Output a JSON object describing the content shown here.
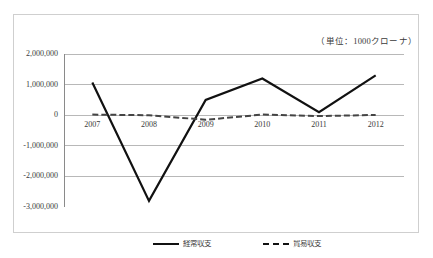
{
  "unit_caption": "（単位：1000クローナ）",
  "chart_data": {
    "type": "line",
    "title": "",
    "subtitle": "",
    "xlabel": "",
    "ylabel": "",
    "unit_note": "（単位：1000クローナ）",
    "categories": [
      "2007",
      "2008",
      "2009",
      "2010",
      "2011",
      "2012"
    ],
    "x_tick_labels": [
      "2007",
      "2008",
      "2009",
      "2010",
      "2011",
      "2012"
    ],
    "y_tick_labels": [
      "2,000,000",
      "1,000,000",
      "0",
      "-1,000,000",
      "-2,000,000",
      "-3,000,000"
    ],
    "y_tick_values": [
      2000000,
      1000000,
      0,
      -1000000,
      -2000000,
      -3000000
    ],
    "ylim": [
      -3000000,
      2000000
    ],
    "grid": true,
    "grid_axis": "y",
    "legend_position": "bottom",
    "series": [
      {
        "name": "経常収支",
        "style": "solid",
        "color": "#111111",
        "values": [
          1070000,
          -2800000,
          500000,
          1200000,
          100000,
          1300000
        ]
      },
      {
        "name": "貿易収支",
        "style": "dashed",
        "color": "#444444",
        "values": [
          20000,
          0,
          -150000,
          20000,
          -30000,
          10000
        ]
      }
    ]
  },
  "legend": [
    {
      "label": "経常収支",
      "style": "solid"
    },
    {
      "label": "貿易収支",
      "style": "dashed"
    }
  ],
  "colors": {
    "series_solid": "#111111",
    "series_dashed": "#444444",
    "gridline": "#b8b8b8",
    "axis": "#8a8a8a",
    "frame": "#cfcfcf",
    "text": "#3a3a3a",
    "background": "#ffffff"
  }
}
